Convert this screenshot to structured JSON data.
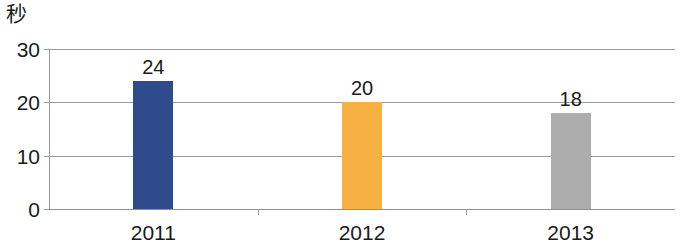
{
  "chart_data": {
    "type": "bar",
    "title": "",
    "subtitle": "",
    "xlabel": "",
    "ylabel": "秒",
    "categories": [
      "2011",
      "2012",
      "2013"
    ],
    "values": [
      24,
      20,
      18
    ],
    "value_labels": [
      "24",
      "20",
      "18"
    ],
    "series": [
      {
        "name": "",
        "values": [
          24,
          20,
          18
        ]
      }
    ],
    "bar_colors": [
      "#2F4B8C",
      "#F7B143",
      "#ADADAD"
    ],
    "ylim": [
      0,
      30
    ],
    "yticks": [
      0,
      10,
      20,
      30
    ],
    "ytick_labels": [
      "0",
      "10",
      "20",
      "30"
    ],
    "grid": true,
    "grid_axis": "y",
    "legend": false,
    "legend_position": "none",
    "axis_color": "#9A9A9A",
    "text_color": "#1A1A1A",
    "background": "#FFFFFF"
  },
  "axis": {
    "unit_label": "秒"
  }
}
